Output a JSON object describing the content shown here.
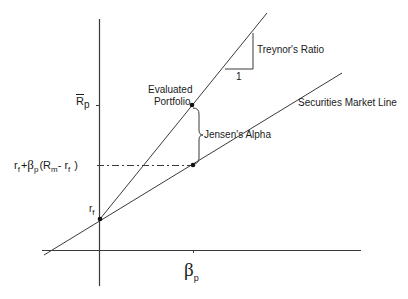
{
  "diagram": {
    "type": "finance-performance-diagram",
    "axes": {
      "x_label_symbol": "β",
      "x_label_sub": "p",
      "y_ticks": [
        {
          "id": "rp_bar",
          "main": "R",
          "sub": "p",
          "overline": true
        },
        {
          "id": "expected_return",
          "text": "r_f + β_p(R_m - r_f)"
        },
        {
          "id": "rf",
          "main": "r",
          "sub": "f"
        }
      ]
    },
    "labels": {
      "treynor": "Treynor's Ratio",
      "slope_unit": "1",
      "evaluated_line1": "Evaluated",
      "evaluated_line2": "Portfolio",
      "jensen": "Jensen's Alpha",
      "sml": "Securities Market Line"
    },
    "expected_return_parts": {
      "r": "r",
      "f": "f",
      "plus": "+",
      "beta": "β",
      "p": "p",
      "open": "(R",
      "m": "m",
      "minus": "- r",
      "f2": "f",
      "close": ")"
    },
    "rp_label": {
      "main": "R",
      "sub": "p"
    },
    "rf_label": {
      "main": "r",
      "sub": "f"
    },
    "beta_label": {
      "main": "β",
      "sub": "p"
    },
    "colors": {
      "line": "#3a3a3a",
      "text": "#1a1a1a",
      "background": "#ffffff"
    },
    "points": [
      {
        "name": "risk-free",
        "x": 100,
        "y": 219
      },
      {
        "name": "evaluated-portfolio",
        "x": 192,
        "y": 105
      },
      {
        "name": "sml-expected",
        "x": 193,
        "y": 165
      }
    ]
  }
}
